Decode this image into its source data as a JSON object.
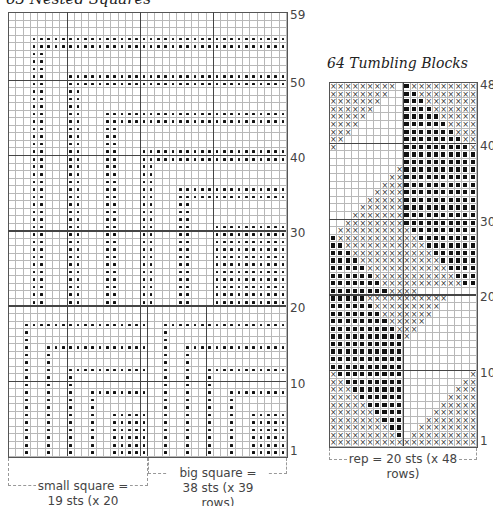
{
  "chart_left": {
    "title": "63 Nested Squares",
    "cols": 38,
    "rows": 59,
    "row_labels": [
      "59",
      "50",
      "40",
      "30",
      "20",
      "10",
      "1"
    ],
    "row_label_values": [
      59,
      50,
      40,
      30,
      20,
      10,
      1
    ],
    "caption_small": [
      "small square =",
      "19 sts (x 20 rows)"
    ],
    "caption_big": [
      "big square =",
      "38 sts (x 39 rows)"
    ],
    "big_square": {
      "cols": 38,
      "rows": 39,
      "first_row": 21,
      "band_width": 2,
      "stride": 5,
      "offset": 3,
      "bands": 5
    },
    "small_square": {
      "cols": 19,
      "rows": 20,
      "first_row": 1,
      "band_width": 1,
      "stride": 3,
      "offset": 2,
      "bands": 4,
      "repeats": 2
    }
  },
  "chart_right": {
    "title": "64 Tumbling Blocks",
    "cols": 20,
    "rows": 48,
    "row_labels": [
      "48",
      "40",
      "30",
      "20",
      "10",
      "1"
    ],
    "row_label_values": [
      48,
      40,
      30,
      20,
      10,
      1
    ],
    "caption": "rep = 20 sts (x 48 rows)"
  },
  "legend": {
    "dot": "purl / dot stitch",
    "x": "cross symbol",
    "filled": "filled square"
  }
}
